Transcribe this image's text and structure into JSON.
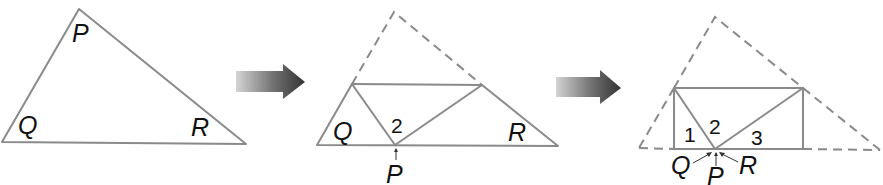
{
  "diagram": {
    "colors": {
      "line": "#8a8a8a",
      "text": "#111111",
      "arrow_dark": "#3a3a3a",
      "arrow_light": "#d0d0d0"
    },
    "step1": {
      "labels": {
        "P": "P",
        "Q": "Q",
        "R": "R"
      }
    },
    "step2": {
      "labels": {
        "Q": "Q",
        "R": "R",
        "P": "P",
        "angle2": "2"
      }
    },
    "step3": {
      "labels": {
        "angle1": "1",
        "angle2": "2",
        "angle3": "3",
        "Q": "Q",
        "P": "P",
        "R": "R"
      }
    },
    "arrows": [
      {
        "name": "arrow-step1-to-step2",
        "icon": "right-arrow-icon"
      },
      {
        "name": "arrow-step2-to-step3",
        "icon": "right-arrow-icon"
      }
    ]
  }
}
